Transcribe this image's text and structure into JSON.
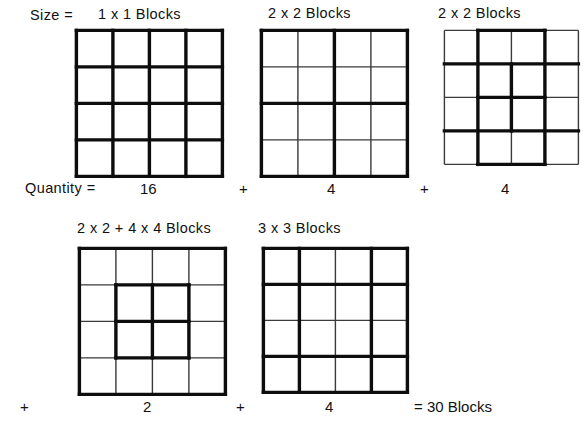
{
  "diagram": {
    "title_row_labels": {
      "size_label": "Size =",
      "quantity_label": "Quantity ="
    },
    "total_text": "= 30 Blocks",
    "operators": {
      "plus": "+",
      "times": "x",
      "equals": "="
    },
    "row1": {
      "items": [
        {
          "size_label": "1 x 1  Blocks",
          "quantity": "16",
          "grid": {
            "cols": 4,
            "rows": 4,
            "thick_v": [
              0,
              1,
              2,
              3,
              4
            ],
            "thick_h": [
              0,
              1,
              2,
              3,
              4
            ],
            "thick_v_spans": [],
            "thick_h_spans": []
          }
        },
        {
          "size_label": "2 x 2  Blocks",
          "quantity": "4",
          "grid": {
            "cols": 4,
            "rows": 4,
            "thick_v": [
              0,
              2,
              4
            ],
            "thick_h": [
              0,
              2,
              4
            ],
            "thick_v_spans": [],
            "thick_h_spans": []
          }
        },
        {
          "size_label": "2 x 2  Blocks",
          "quantity": "4",
          "grid": {
            "cols": 4,
            "rows": 4,
            "thick_v": [],
            "thick_h": [],
            "thick_v_spans": [
              {
                "x": 1,
                "y0": 0,
                "y1": 4
              },
              {
                "x": 3,
                "y0": 0,
                "y1": 4
              },
              {
                "x": 2,
                "y0": 1,
                "y1": 3
              }
            ],
            "thick_h_spans": [
              {
                "y": 1,
                "x0": 0,
                "x1": 4
              },
              {
                "y": 3,
                "x0": 0,
                "x1": 4
              },
              {
                "y": 0,
                "x0": 1,
                "x1": 3
              },
              {
                "y": 4,
                "x0": 1,
                "x1": 3
              },
              {
                "y": 2,
                "x0": 1,
                "x1": 3
              }
            ]
          }
        }
      ],
      "separators": [
        "+",
        "+"
      ]
    },
    "row2": {
      "items": [
        {
          "size_label": "2 x 2 + 4 x 4  Blocks",
          "quantity": "2",
          "grid": {
            "cols": 4,
            "rows": 4,
            "thick_v": [
              0,
              4
            ],
            "thick_h": [
              0,
              4
            ],
            "thick_v_spans": [
              {
                "x": 1,
                "y0": 1,
                "y1": 3
              },
              {
                "x": 3,
                "y0": 1,
                "y1": 3
              },
              {
                "x": 2,
                "y0": 1,
                "y1": 3
              }
            ],
            "thick_h_spans": [
              {
                "y": 1,
                "x0": 1,
                "x1": 3
              },
              {
                "y": 3,
                "x0": 1,
                "x1": 3
              },
              {
                "y": 2,
                "x0": 1,
                "x1": 3
              }
            ]
          }
        },
        {
          "size_label": "3 x 3  Blocks",
          "quantity": "4",
          "grid": {
            "cols": 4,
            "rows": 4,
            "thick_v": [
              0,
              1,
              3,
              4
            ],
            "thick_h": [
              0,
              1,
              3,
              4
            ],
            "thick_v_spans": [],
            "thick_h_spans": []
          }
        }
      ],
      "separators": [
        "+",
        "+"
      ]
    },
    "colors": {
      "ink": "#111111",
      "paper": "#ffffff",
      "thin_line": "#3a3a3a",
      "thick_line": "#0d0d0d"
    },
    "line_widths": {
      "thin": 1.4,
      "thick": 3.4
    }
  }
}
